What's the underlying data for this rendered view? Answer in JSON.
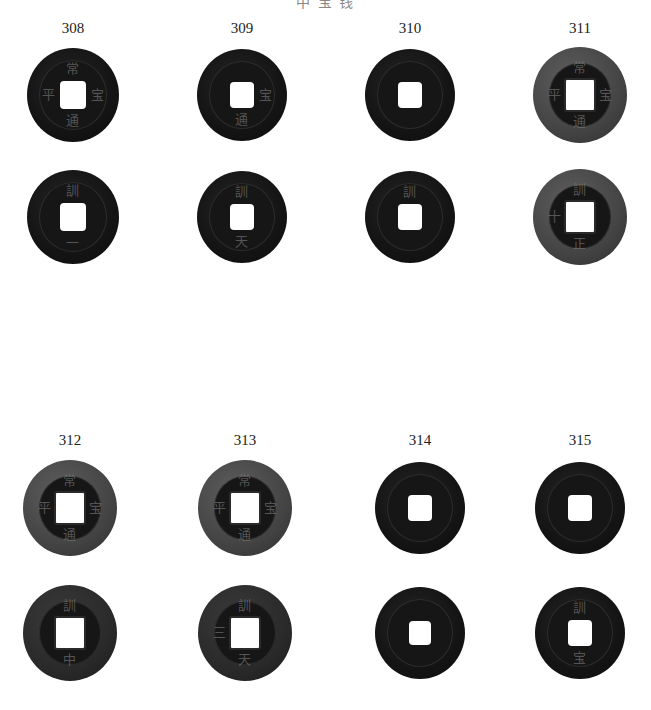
{
  "header": {
    "text": "中 宝 钱"
  },
  "colors": {
    "dark": "#141414",
    "rim_gray": "#4a4a4a",
    "background": "#ffffff"
  },
  "plates": [
    {
      "row_top": 20,
      "labels": [
        "308",
        "309",
        "310",
        "311"
      ],
      "coins": [
        {
          "id": "308-obverse",
          "cx": 73,
          "cy": 95,
          "w": 92,
          "h": 94,
          "style": "dark",
          "hole": 26,
          "glyphs": [
            "常",
            "平",
            "通",
            "宝"
          ]
        },
        {
          "id": "309-obverse",
          "cx": 242,
          "cy": 95,
          "w": 90,
          "h": 92,
          "style": "dark",
          "hole": 24,
          "glyphs": [
            "",
            "",
            "通",
            "宝"
          ]
        },
        {
          "id": "310-obverse",
          "cx": 410,
          "cy": 95,
          "w": 90,
          "h": 92,
          "style": "dark",
          "hole": 24,
          "glyphs": [
            "",
            "",
            "",
            ""
          ]
        },
        {
          "id": "311-obverse",
          "cx": 580,
          "cy": 95,
          "w": 94,
          "h": 96,
          "style": "rimmed",
          "hole": 28,
          "glyphs": [
            "常",
            "平",
            "通",
            "宝"
          ]
        },
        {
          "id": "308-reverse",
          "cx": 73,
          "cy": 217,
          "w": 92,
          "h": 94,
          "style": "dark",
          "hole": 26,
          "glyphs": [
            "訓",
            "",
            "一",
            ""
          ]
        },
        {
          "id": "309-reverse",
          "cx": 242,
          "cy": 217,
          "w": 90,
          "h": 92,
          "style": "dark",
          "hole": 24,
          "glyphs": [
            "訓",
            "",
            "天",
            ""
          ]
        },
        {
          "id": "310-reverse",
          "cx": 410,
          "cy": 217,
          "w": 90,
          "h": 92,
          "style": "dark",
          "hole": 24,
          "glyphs": [
            "訓",
            "",
            "",
            ""
          ]
        },
        {
          "id": "311-reverse",
          "cx": 580,
          "cy": 217,
          "w": 94,
          "h": 96,
          "style": "rimmed",
          "hole": 28,
          "glyphs": [
            "訓",
            "十",
            "正",
            ""
          ]
        }
      ]
    },
    {
      "row_top": 432,
      "labels": [
        "312",
        "313",
        "314",
        "315"
      ],
      "coins": [
        {
          "id": "312-obverse",
          "cx": 70,
          "cy": 508,
          "w": 94,
          "h": 96,
          "style": "rimmed",
          "hole": 28,
          "glyphs": [
            "常",
            "平",
            "通",
            "宝"
          ]
        },
        {
          "id": "313-obverse",
          "cx": 245,
          "cy": 508,
          "w": 94,
          "h": 96,
          "style": "rimmed",
          "hole": 28,
          "glyphs": [
            "常",
            "平",
            "通",
            "宝"
          ]
        },
        {
          "id": "314-obverse",
          "cx": 420,
          "cy": 508,
          "w": 90,
          "h": 92,
          "style": "dark",
          "hole": 24,
          "glyphs": [
            "",
            "",
            "",
            ""
          ]
        },
        {
          "id": "315-obverse",
          "cx": 580,
          "cy": 508,
          "w": 90,
          "h": 92,
          "style": "dark",
          "hole": 24,
          "glyphs": [
            "",
            "",
            "",
            ""
          ]
        },
        {
          "id": "312-reverse",
          "cx": 70,
          "cy": 633,
          "w": 94,
          "h": 96,
          "style": "rimmed-dark",
          "hole": 28,
          "glyphs": [
            "訓",
            "",
            "中",
            ""
          ]
        },
        {
          "id": "313-reverse",
          "cx": 245,
          "cy": 633,
          "w": 94,
          "h": 96,
          "style": "rimmed-dark",
          "hole": 28,
          "glyphs": [
            "訓",
            "三",
            "天",
            ""
          ]
        },
        {
          "id": "314-reverse",
          "cx": 420,
          "cy": 633,
          "w": 90,
          "h": 92,
          "style": "dark",
          "hole": 22,
          "glyphs": [
            "",
            "",
            "",
            ""
          ]
        },
        {
          "id": "315-reverse",
          "cx": 580,
          "cy": 633,
          "w": 90,
          "h": 92,
          "style": "dark",
          "hole": 24,
          "glyphs": [
            "訓",
            "",
            "宝",
            ""
          ]
        }
      ]
    }
  ]
}
